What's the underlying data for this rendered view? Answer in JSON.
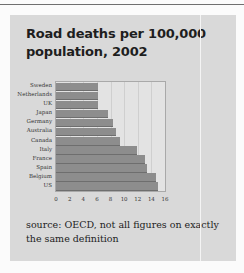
{
  "chart_data": {
    "type": "bar",
    "orientation": "horizontal",
    "title": "Road deaths per 100,000 population, 2002",
    "categories": [
      "Sweden",
      "Netherlands",
      "UK",
      "Japan",
      "Germany",
      "Australia",
      "Canada",
      "Italy",
      "France",
      "Spain",
      "Belgium",
      "US"
    ],
    "values": [
      6.1,
      6.2,
      6.2,
      7.6,
      8.3,
      8.8,
      9.4,
      11.9,
      13.0,
      13.3,
      14.7,
      15.0
    ],
    "xlabel": "",
    "ylabel": "",
    "xlim": [
      0,
      16
    ],
    "xticks": [
      "0",
      "2",
      "4",
      "6",
      "8",
      "10",
      "12",
      "14",
      "16"
    ],
    "grid": true,
    "legend": null,
    "annotation": "source: OECD, not all figures on exactly the same definition"
  },
  "card": {
    "title": "Road deaths per 100,000 population, 2002",
    "source_note": "source: OECD, not all figures on exactly the same definition"
  },
  "colors": {
    "bar": "#8d8d8d",
    "card_background": "#d9d9d9",
    "plot_background": "#e3e3e3"
  }
}
